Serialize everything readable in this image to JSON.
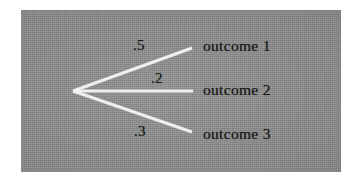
{
  "figure": {
    "kind": "probability-fan-diagram",
    "panel": {
      "background_color": "#8b8b8b",
      "branch_color": "#f2f2f2",
      "text_color": "#141414"
    }
  },
  "node": {
    "label": "",
    "x": 73,
    "y": 91
  },
  "branches": [
    {
      "probability": ".5",
      "outcome": "outcome 1",
      "start_x": 73,
      "start_y": 91,
      "end_x": 192,
      "end_y": 48,
      "prob_x": 133,
      "prob_y": 38,
      "outcome_x": 203,
      "outcome_y": 38
    },
    {
      "probability": ".2",
      "outcome": "outcome 2",
      "start_x": 73,
      "start_y": 91,
      "end_x": 193,
      "end_y": 91,
      "prob_x": 151,
      "prob_y": 71,
      "outcome_x": 203,
      "outcome_y": 82
    },
    {
      "probability": ".3",
      "outcome": "outcome 3",
      "start_x": 73,
      "start_y": 91,
      "end_x": 192,
      "end_y": 132,
      "prob_x": 134,
      "prob_y": 124,
      "outcome_x": 203,
      "outcome_y": 126
    }
  ],
  "chart_data": {
    "type": "diagram",
    "title": "",
    "categories": [
      "outcome 1",
      "outcome 2",
      "outcome 3"
    ],
    "values": [
      0.5,
      0.2,
      0.3
    ],
    "value_labels": [
      ".5",
      ".2",
      ".3"
    ],
    "xlabel": "",
    "ylabel": "",
    "legend": []
  }
}
